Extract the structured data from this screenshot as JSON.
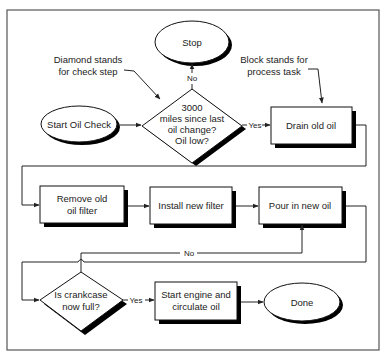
{
  "diagram": {
    "type": "flowchart",
    "annotations": {
      "diamond_line1": "Diamond stands",
      "diamond_line2": "for check step",
      "block_line1": "Block stands for",
      "block_line2": "process task"
    },
    "nodes": {
      "stop": "Stop",
      "start": "Start Oil Check",
      "check_line1": "3000",
      "check_line2": "miles since last",
      "check_line3": "oil change?",
      "check_line4": "Oil low?",
      "drain": "Drain old oil",
      "remove_line1": "Remove old",
      "remove_line2": "oil filter",
      "install": "Install new filter",
      "pour": "Pour in new oil",
      "full_line1": "Is crankcase",
      "full_line2": "now full?",
      "engine_line1": "Start engine and",
      "engine_line2": "circulate oil",
      "done": "Done"
    },
    "edge_labels": {
      "check_no": "No",
      "check_yes": "Yes",
      "full_no": "No",
      "full_yes": "Yes"
    },
    "edges": [
      {
        "from": "Start Oil Check",
        "to": "3000 miles since last oil change? Oil low?"
      },
      {
        "from": "3000 miles since last oil change? Oil low?",
        "to": "Stop",
        "label": "No"
      },
      {
        "from": "3000 miles since last oil change? Oil low?",
        "to": "Drain old oil",
        "label": "Yes"
      },
      {
        "from": "Drain old oil",
        "to": "Remove old oil filter"
      },
      {
        "from": "Remove old oil filter",
        "to": "Install new filter"
      },
      {
        "from": "Install new filter",
        "to": "Pour in new oil"
      },
      {
        "from": "Pour in new oil",
        "to": "Is crankcase now full?"
      },
      {
        "from": "Is crankcase now full?",
        "to": "Pour in new oil",
        "label": "No"
      },
      {
        "from": "Is crankcase now full?",
        "to": "Start engine and circulate oil",
        "label": "Yes"
      },
      {
        "from": "Start engine and circulate oil",
        "to": "Done"
      }
    ]
  }
}
